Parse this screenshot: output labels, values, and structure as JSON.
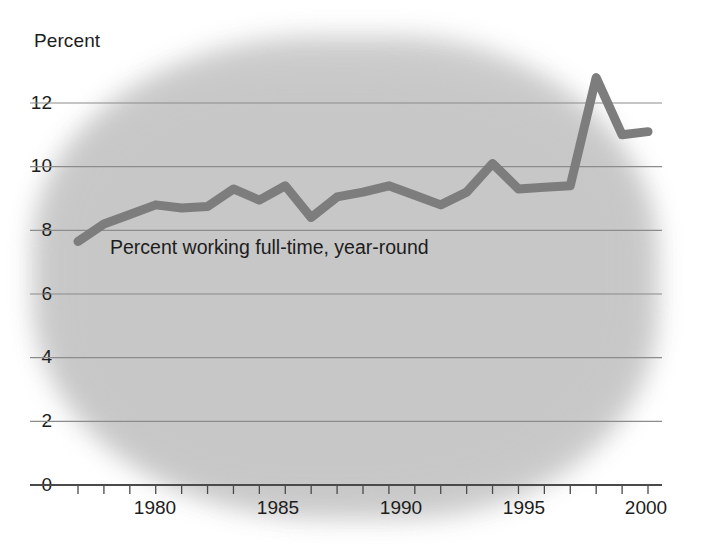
{
  "chart_data": {
    "type": "line",
    "title": "",
    "subtitle": "",
    "ylabel": "Percent",
    "xlabel": "",
    "ylim": [
      0,
      13.2
    ],
    "xlim": [
      1977.6,
      2000.6
    ],
    "yticks": [
      0,
      2,
      4,
      6,
      8,
      10,
      12
    ],
    "ytick_labels": [
      "0",
      "2",
      "4",
      "6",
      "8",
      "10",
      "12"
    ],
    "xticks": [
      1980,
      1985,
      1990,
      1995,
      2000
    ],
    "xtick_labels": [
      "1980",
      "1985",
      "1990",
      "1995",
      "2000"
    ],
    "minor_xticks_every": 1,
    "grid": "horizontal",
    "legend_position": "inline-annotation",
    "annotations": [
      {
        "text": "Percent working full-time, year-round",
        "x": 1979.2,
        "y": 7.05
      }
    ],
    "series": [
      {
        "name": "Percent working full-time, year-round",
        "color": "#7d7d7d",
        "line_width": 9,
        "x": [
          1978,
          1979,
          1980,
          1981,
          1982,
          1983,
          1984,
          1985,
          1986,
          1987,
          1988,
          1989,
          1990,
          1991,
          1992,
          1993,
          1994,
          1995,
          1996,
          1997,
          1998,
          1999,
          2000
        ],
        "values": [
          7.65,
          8.2,
          8.5,
          8.8,
          8.7,
          8.75,
          9.3,
          8.95,
          9.4,
          8.4,
          9.05,
          9.2,
          9.4,
          9.1,
          8.8,
          9.2,
          10.1,
          9.3,
          9.35,
          9.4,
          12.8,
          11.0,
          11.1
        ]
      }
    ]
  },
  "plot_geometry": {
    "x_left_px": 78,
    "x_right_px": 648,
    "y_zero_px": 485,
    "y_twelve_px": 103,
    "grid_left_px": 30,
    "grid_right_px": 662
  },
  "colors": {
    "background": "#ffffff",
    "blob": "#c9c9c9",
    "gridline": "#8c8c8c",
    "axis": "#4a4a4a",
    "series": "#7d7d7d",
    "text": "#1d1d1d"
  }
}
